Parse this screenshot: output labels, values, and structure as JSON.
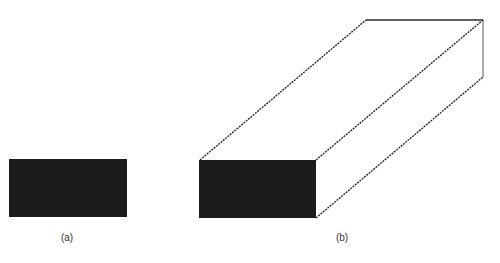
{
  "figure": {
    "panels": [
      {
        "id": "a",
        "label": "(a)",
        "description": "Solid black rectangle (2D cross-section)",
        "rect": {
          "x": 9,
          "y": 159,
          "w": 118,
          "h": 58
        },
        "label_pos": {
          "x": 67,
          "y": 232
        }
      },
      {
        "id": "b",
        "label": "(b)",
        "description": "Extruded rectangular prism with black front face and dashed receding edges",
        "front_face": {
          "x": 199,
          "y": 160,
          "w": 117,
          "h": 58
        },
        "back_face": {
          "x": 366,
          "y": 20,
          "w": 117,
          "h": 57
        },
        "label_pos": {
          "x": 342,
          "y": 232
        }
      }
    ],
    "colors": {
      "fill": "#1c1c1c",
      "edge": "#2a2a2a",
      "label": "#333333",
      "background": "#ffffff"
    }
  }
}
